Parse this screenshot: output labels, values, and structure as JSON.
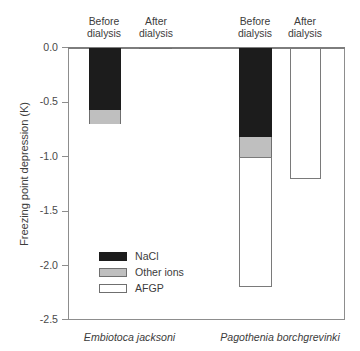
{
  "chart_data": {
    "type": "bar",
    "title": "",
    "subtitle": "",
    "xlabel": "",
    "ylabel": "Freezing point depression (K)",
    "ylim": [
      -2.5,
      0.0
    ],
    "yticks": [
      "0.0",
      "-0.5",
      "-1.0",
      "-1.5",
      "-2.0",
      "-2.5"
    ],
    "ytick_values": [
      0.0,
      -0.5,
      -1.0,
      -1.5,
      -2.0,
      -2.5
    ],
    "grid": false,
    "legend_position": "inside-lower-left",
    "stacked": true,
    "legend": [
      "NaCl",
      "Other ions",
      "AFGP"
    ],
    "series": [
      {
        "name": "NaCl",
        "color": "#1c1c1c",
        "values": [
          -0.57,
          -0.01,
          -0.82,
          0.0
        ]
      },
      {
        "name": "Other ions",
        "color": "#bfbfbf",
        "values": [
          -0.13,
          0.0,
          -0.18,
          0.0
        ]
      },
      {
        "name": "AFGP",
        "color": "#ffffff",
        "values": [
          0.0,
          0.0,
          -1.2,
          -1.2
        ]
      }
    ],
    "categories": [
      "Before dialysis",
      "After dialysis",
      "Before dialysis",
      "After dialysis"
    ],
    "group_labels": [
      "Embiotoca jacksoni",
      "Pagothenia borchgrevinki"
    ],
    "bars": [
      {
        "group": "Embiotoca jacksoni",
        "condition": "Before dialysis",
        "total": -0.7,
        "segments": [
          {
            "name": "NaCl",
            "from": 0.0,
            "to": -0.57
          },
          {
            "name": "Other ions",
            "from": -0.57,
            "to": -0.7
          }
        ]
      },
      {
        "group": "Embiotoca jacksoni",
        "condition": "After dialysis",
        "total": -0.01,
        "segments": [
          {
            "name": "NaCl",
            "from": 0.0,
            "to": -0.01
          }
        ]
      },
      {
        "group": "Pagothenia borchgrevinki",
        "condition": "Before dialysis",
        "total": -2.2,
        "segments": [
          {
            "name": "NaCl",
            "from": 0.0,
            "to": -0.82
          },
          {
            "name": "Other ions",
            "from": -0.82,
            "to": -1.0
          },
          {
            "name": "AFGP",
            "from": -1.0,
            "to": -2.2
          }
        ]
      },
      {
        "group": "Pagothenia borchgrevinki",
        "condition": "After dialysis",
        "total": -1.2,
        "segments": [
          {
            "name": "AFGP",
            "from": 0.0,
            "to": -1.2
          }
        ]
      }
    ]
  },
  "axis": {
    "y_title": "Freezing point depression (K)",
    "ticks": {
      "t0": "0.0",
      "t1": "-0.5",
      "t2": "-1.0",
      "t3": "-1.5",
      "t4": "-2.0",
      "t5": "-2.5"
    }
  },
  "headers": {
    "h1_line1": "Before",
    "h1_line2": "dialysis",
    "h2_line1": "After",
    "h2_line2": "dialysis",
    "h3_line1": "Before",
    "h3_line2": "dialysis",
    "h4_line1": "After",
    "h4_line2": "dialysis"
  },
  "legend": {
    "items": [
      {
        "label": "NaCl",
        "color": "#1c1c1c"
      },
      {
        "label": "Other ions",
        "color": "#bfbfbf"
      },
      {
        "label": "AFGP",
        "color": "#ffffff"
      }
    ]
  },
  "species": {
    "first": "Embiotoca jacksoni",
    "second": "Pagothenia borchgrevinki"
  }
}
